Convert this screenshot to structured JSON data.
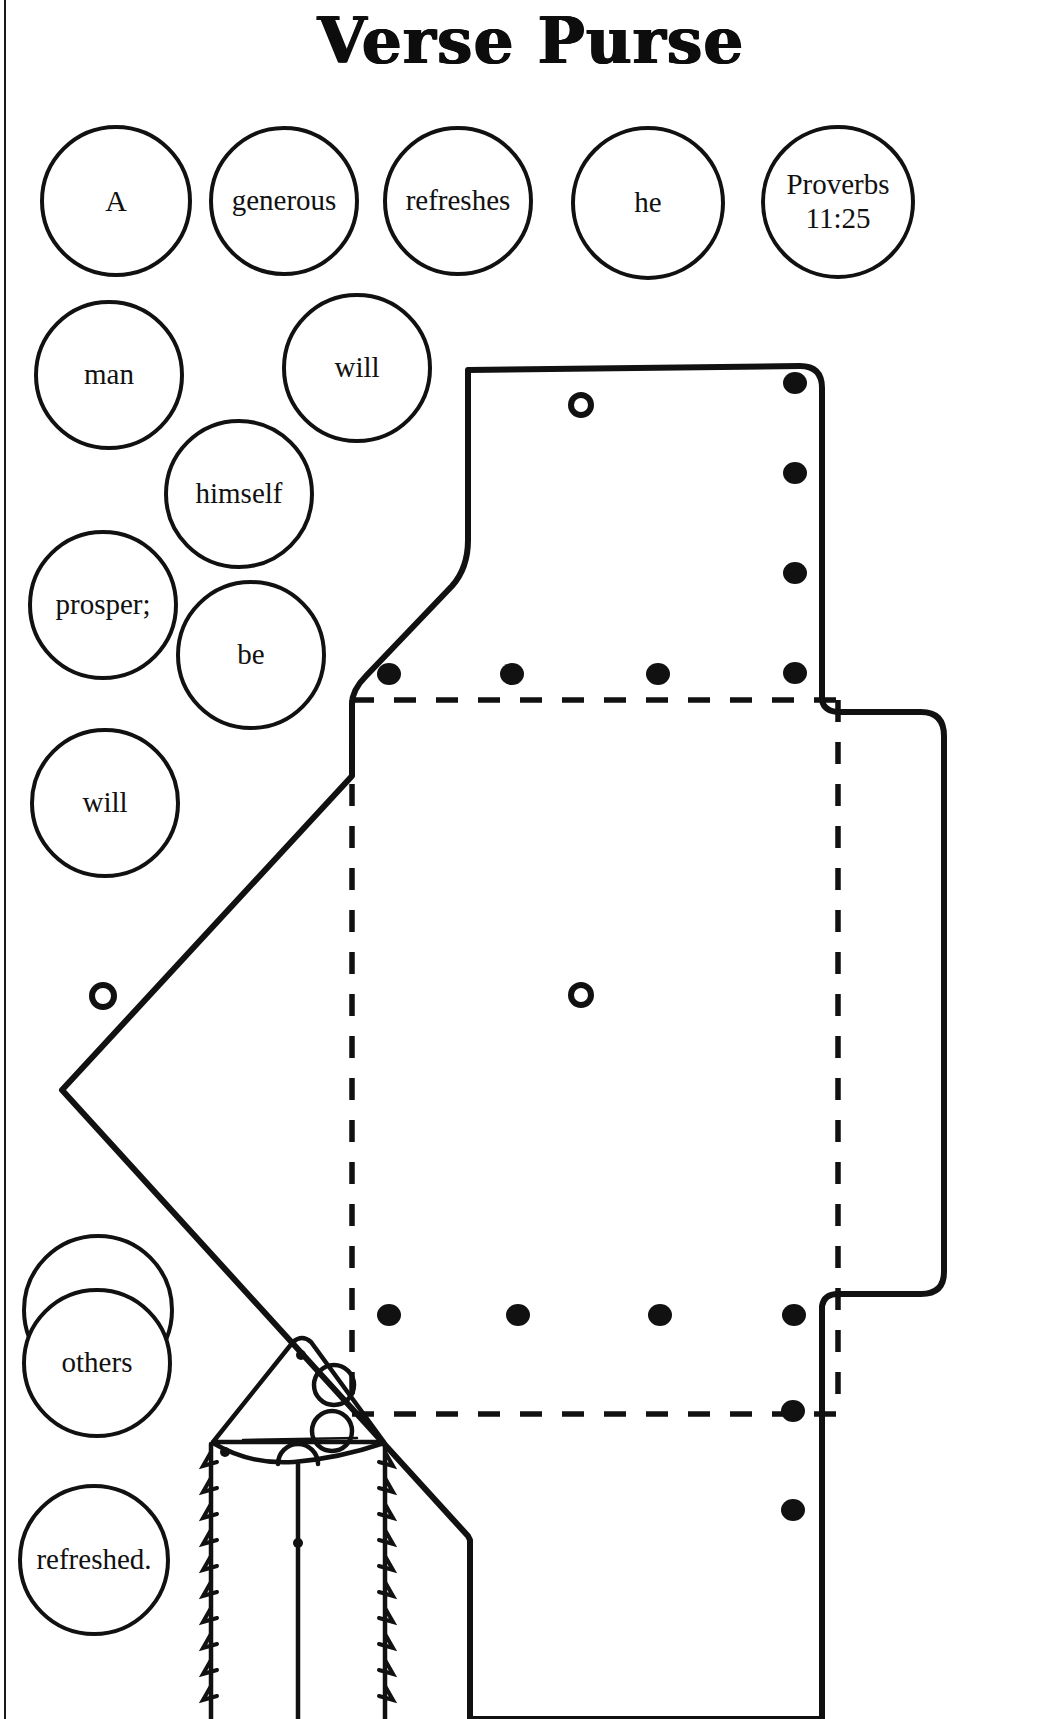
{
  "page": {
    "title": "Verse Purse",
    "background_color": "#ffffff",
    "ink_color": "#111111",
    "width": 1062,
    "height": 1719
  },
  "verse": {
    "reference": "Proverbs 11:25",
    "text": "A generous man will prosper; he who refreshes others will himself be refreshed."
  },
  "word_circles": [
    {
      "label": "A",
      "x": 40,
      "y": 125,
      "size": 152,
      "font_size": 30
    },
    {
      "label": "generous",
      "x": 209,
      "y": 126,
      "size": 150,
      "font_size": 29
    },
    {
      "label": "refreshes",
      "x": 383,
      "y": 126,
      "size": 150,
      "font_size": 29
    },
    {
      "label": "he",
      "x": 571,
      "y": 126,
      "size": 154,
      "font_size": 29
    },
    {
      "label": "Proverbs\n11:25",
      "x": 761,
      "y": 125,
      "size": 154,
      "font_size": 29
    },
    {
      "label": "man",
      "x": 34,
      "y": 300,
      "size": 150,
      "font_size": 29
    },
    {
      "label": "will",
      "x": 282,
      "y": 293,
      "size": 150,
      "font_size": 29
    },
    {
      "label": "himself",
      "x": 164,
      "y": 419,
      "size": 150,
      "font_size": 29
    },
    {
      "label": "prosper;",
      "x": 28,
      "y": 530,
      "size": 150,
      "font_size": 29
    },
    {
      "label": "be",
      "x": 176,
      "y": 580,
      "size": 150,
      "font_size": 29
    },
    {
      "label": "will",
      "x": 30,
      "y": 728,
      "size": 150,
      "font_size": 29
    },
    {
      "label": "who",
      "x": 22,
      "y": 1234,
      "size": 152,
      "font_size": 29
    },
    {
      "label": "others",
      "x": 22,
      "y": 1288,
      "size": 150,
      "font_size": 29
    },
    {
      "label": "refreshed.",
      "x": 18,
      "y": 1484,
      "size": 152,
      "font_size": 29
    }
  ],
  "pattern": {
    "name": "verse-purse-cut-pattern",
    "outline_stroke_width": 6,
    "fold_line_style": "dashed",
    "punch_hole_count_large": 2,
    "punch_dot_rows": 2,
    "punch_dot_columns": 2
  },
  "thumbnail": {
    "name": "finished-purse-illustration",
    "description": "Small line drawing of the finished laced purse with flap and button"
  }
}
